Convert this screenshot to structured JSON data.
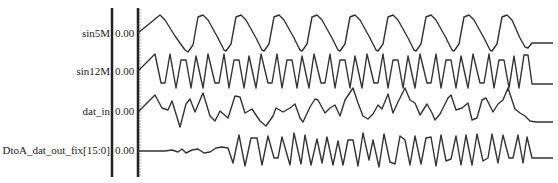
{
  "signals": [
    {
      "name": "sin5M",
      "value": "0.00",
      "y": 34
    },
    {
      "name": "sin12M",
      "value": "0.00",
      "y": 72
    },
    {
      "name": "dat_in",
      "value": "0.00",
      "y": 112
    },
    {
      "name": "DtoA_dat_out_fix[15:0]",
      "value": "0.00",
      "y": 151
    }
  ],
  "colors": {
    "line": "#333333",
    "divider": "#222222",
    "background": "#ffffff"
  },
  "chart_data": {
    "type": "line",
    "title": "",
    "xlabel": "",
    "ylabel": "",
    "series": [
      {
        "name": "sin5M",
        "baseline_value": "0.00",
        "points": [
          [
            138,
            33
          ],
          [
            160,
            15
          ],
          [
            165,
            20
          ],
          [
            175,
            36
          ],
          [
            185,
            50
          ],
          [
            188,
            52
          ],
          [
            193,
            45
          ],
          [
            198,
            17
          ],
          [
            203,
            15
          ],
          [
            208,
            20
          ],
          [
            218,
            38
          ],
          [
            224,
            50
          ],
          [
            226,
            51
          ],
          [
            231,
            44
          ],
          [
            236,
            17
          ],
          [
            241,
            15
          ],
          [
            246,
            20
          ],
          [
            256,
            38
          ],
          [
            262,
            50
          ],
          [
            264,
            51
          ],
          [
            269,
            44
          ],
          [
            274,
            17
          ],
          [
            279,
            15
          ],
          [
            284,
            20
          ],
          [
            294,
            38
          ],
          [
            300,
            50
          ],
          [
            302,
            51
          ],
          [
            307,
            44
          ],
          [
            312,
            17
          ],
          [
            317,
            15
          ],
          [
            322,
            20
          ],
          [
            332,
            38
          ],
          [
            338,
            50
          ],
          [
            340,
            51
          ],
          [
            345,
            44
          ],
          [
            350,
            17
          ],
          [
            355,
            15
          ],
          [
            360,
            20
          ],
          [
            370,
            38
          ],
          [
            376,
            50
          ],
          [
            378,
            51
          ],
          [
            383,
            44
          ],
          [
            388,
            17
          ],
          [
            393,
            15
          ],
          [
            398,
            20
          ],
          [
            408,
            38
          ],
          [
            414,
            50
          ],
          [
            416,
            51
          ],
          [
            421,
            44
          ],
          [
            426,
            17
          ],
          [
            431,
            15
          ],
          [
            436,
            20
          ],
          [
            446,
            38
          ],
          [
            452,
            50
          ],
          [
            454,
            51
          ],
          [
            459,
            44
          ],
          [
            464,
            17
          ],
          [
            469,
            15
          ],
          [
            474,
            20
          ],
          [
            484,
            38
          ],
          [
            490,
            50
          ],
          [
            492,
            51
          ],
          [
            497,
            44
          ],
          [
            502,
            17
          ],
          [
            507,
            15
          ],
          [
            512,
            20
          ],
          [
            520,
            38
          ],
          [
            525,
            47
          ],
          [
            528,
            48
          ],
          [
            532,
            43
          ],
          [
            553,
            43
          ]
        ]
      },
      {
        "name": "sin12M",
        "baseline_value": "0.00",
        "points": [
          [
            138,
            71
          ],
          [
            155,
            54
          ],
          [
            161,
            83
          ],
          [
            165,
            83
          ],
          [
            170,
            54
          ],
          [
            176,
            88
          ],
          [
            181,
            60
          ],
          [
            186,
            60
          ],
          [
            191,
            88
          ],
          [
            196,
            56
          ],
          [
            203,
            88
          ],
          [
            208,
            54
          ],
          [
            215,
            83
          ],
          [
            219,
            83
          ],
          [
            224,
            54
          ],
          [
            229,
            88
          ],
          [
            234,
            60
          ],
          [
            239,
            60
          ],
          [
            244,
            88
          ],
          [
            249,
            56
          ],
          [
            256,
            88
          ],
          [
            261,
            54
          ],
          [
            268,
            83
          ],
          [
            272,
            83
          ],
          [
            277,
            54
          ],
          [
            282,
            88
          ],
          [
            287,
            60
          ],
          [
            292,
            60
          ],
          [
            297,
            88
          ],
          [
            302,
            56
          ],
          [
            309,
            88
          ],
          [
            314,
            54
          ],
          [
            321,
            83
          ],
          [
            325,
            83
          ],
          [
            330,
            54
          ],
          [
            335,
            88
          ],
          [
            340,
            60
          ],
          [
            345,
            60
          ],
          [
            350,
            88
          ],
          [
            355,
            56
          ],
          [
            362,
            88
          ],
          [
            367,
            54
          ],
          [
            374,
            83
          ],
          [
            378,
            83
          ],
          [
            383,
            54
          ],
          [
            388,
            88
          ],
          [
            393,
            60
          ],
          [
            398,
            60
          ],
          [
            403,
            88
          ],
          [
            408,
            56
          ],
          [
            415,
            88
          ],
          [
            420,
            54
          ],
          [
            427,
            83
          ],
          [
            431,
            83
          ],
          [
            436,
            54
          ],
          [
            441,
            88
          ],
          [
            446,
            60
          ],
          [
            451,
            60
          ],
          [
            456,
            88
          ],
          [
            461,
            56
          ],
          [
            468,
            88
          ],
          [
            473,
            54
          ],
          [
            480,
            83
          ],
          [
            484,
            83
          ],
          [
            489,
            54
          ],
          [
            494,
            88
          ],
          [
            499,
            60
          ],
          [
            504,
            60
          ],
          [
            509,
            88
          ],
          [
            514,
            56
          ],
          [
            519,
            88
          ],
          [
            524,
            55
          ],
          [
            528,
            55
          ],
          [
            532,
            84
          ],
          [
            553,
            84
          ]
        ]
      },
      {
        "name": "dat_in",
        "baseline_value": "0.00",
        "points": [
          [
            138,
            112
          ],
          [
            155,
            95
          ],
          [
            162,
            108
          ],
          [
            168,
            110
          ],
          [
            172,
            101
          ],
          [
            180,
            127
          ],
          [
            186,
            104
          ],
          [
            190,
            99
          ],
          [
            195,
            112
          ],
          [
            203,
            93
          ],
          [
            210,
            116
          ],
          [
            215,
            121
          ],
          [
            220,
            111
          ],
          [
            228,
            118
          ],
          [
            235,
            96
          ],
          [
            240,
            97
          ],
          [
            245,
            113
          ],
          [
            252,
            109
          ],
          [
            260,
            121
          ],
          [
            266,
            126
          ],
          [
            273,
            116
          ],
          [
            276,
            108
          ],
          [
            283,
            112
          ],
          [
            290,
            108
          ],
          [
            295,
            104
          ],
          [
            300,
            118
          ],
          [
            303,
            122
          ],
          [
            310,
            107
          ],
          [
            315,
            99
          ],
          [
            318,
            100
          ],
          [
            325,
            113
          ],
          [
            330,
            108
          ],
          [
            335,
            105
          ],
          [
            340,
            116
          ],
          [
            345,
            100
          ],
          [
            353,
            88
          ],
          [
            358,
            103
          ],
          [
            363,
            116
          ],
          [
            368,
            119
          ],
          [
            373,
            114
          ],
          [
            378,
            105
          ],
          [
            382,
            109
          ],
          [
            388,
            94
          ],
          [
            393,
            113
          ],
          [
            398,
            102
          ],
          [
            405,
            88
          ],
          [
            410,
            100
          ],
          [
            415,
            103
          ],
          [
            420,
            115
          ],
          [
            427,
            104
          ],
          [
            432,
            113
          ],
          [
            435,
            120
          ],
          [
            440,
            114
          ],
          [
            448,
            98
          ],
          [
            451,
            95
          ],
          [
            456,
            110
          ],
          [
            462,
            108
          ],
          [
            468,
            103
          ],
          [
            472,
            120
          ],
          [
            477,
            118
          ],
          [
            482,
            100
          ],
          [
            486,
            98
          ],
          [
            493,
            112
          ],
          [
            498,
            104
          ],
          [
            503,
            100
          ],
          [
            508,
            88
          ],
          [
            515,
            109
          ],
          [
            520,
            113
          ],
          [
            525,
            116
          ],
          [
            530,
            121
          ],
          [
            536,
            122
          ],
          [
            553,
            122
          ]
        ]
      },
      {
        "name": "DtoA_dat_out_fix[15:0]",
        "baseline_value": "0.00",
        "points": [
          [
            138,
            151
          ],
          [
            155,
            151
          ],
          [
            165,
            151
          ],
          [
            172,
            150
          ],
          [
            178,
            152
          ],
          [
            182,
            149
          ],
          [
            186,
            153
          ],
          [
            192,
            150
          ],
          [
            198,
            149
          ],
          [
            204,
            153
          ],
          [
            210,
            152
          ],
          [
            216,
            148
          ],
          [
            222,
            147
          ],
          [
            228,
            148
          ],
          [
            233,
            163
          ],
          [
            239,
            135
          ],
          [
            245,
            166
          ],
          [
            251,
            138
          ],
          [
            257,
            138
          ],
          [
            262,
            165
          ],
          [
            268,
            136
          ],
          [
            274,
            158
          ],
          [
            278,
            158
          ],
          [
            282,
            137
          ],
          [
            290,
            165
          ],
          [
            294,
            133
          ],
          [
            301,
            164
          ],
          [
            305,
            135
          ],
          [
            311,
            165
          ],
          [
            317,
            139
          ],
          [
            322,
            163
          ],
          [
            327,
            137
          ],
          [
            333,
            165
          ],
          [
            338,
            141
          ],
          [
            343,
            165
          ],
          [
            348,
            140
          ],
          [
            353,
            140
          ],
          [
            358,
            166
          ],
          [
            363,
            133
          ],
          [
            369,
            160
          ],
          [
            373,
            140
          ],
          [
            379,
            167
          ],
          [
            384,
            134
          ],
          [
            390,
            162
          ],
          [
            395,
            164
          ],
          [
            400,
            136
          ],
          [
            405,
            140
          ],
          [
            410,
            165
          ],
          [
            415,
            136
          ],
          [
            421,
            164
          ],
          [
            426,
            138
          ],
          [
            431,
            137
          ],
          [
            436,
            166
          ],
          [
            441,
            135
          ],
          [
            446,
            161
          ],
          [
            451,
            159
          ],
          [
            456,
            136
          ],
          [
            461,
            165
          ],
          [
            466,
            135
          ],
          [
            472,
            165
          ],
          [
            477,
            134
          ],
          [
            483,
            161
          ],
          [
            488,
            158
          ],
          [
            492,
            134
          ],
          [
            498,
            163
          ],
          [
            503,
            135
          ],
          [
            509,
            158
          ],
          [
            513,
            158
          ],
          [
            518,
            135
          ],
          [
            523,
            163
          ],
          [
            527,
            137
          ],
          [
            532,
            158
          ],
          [
            553,
            158
          ]
        ]
      }
    ],
    "grid": false,
    "legend": "left-labels",
    "dividers_x": [
      112,
      138
    ]
  }
}
